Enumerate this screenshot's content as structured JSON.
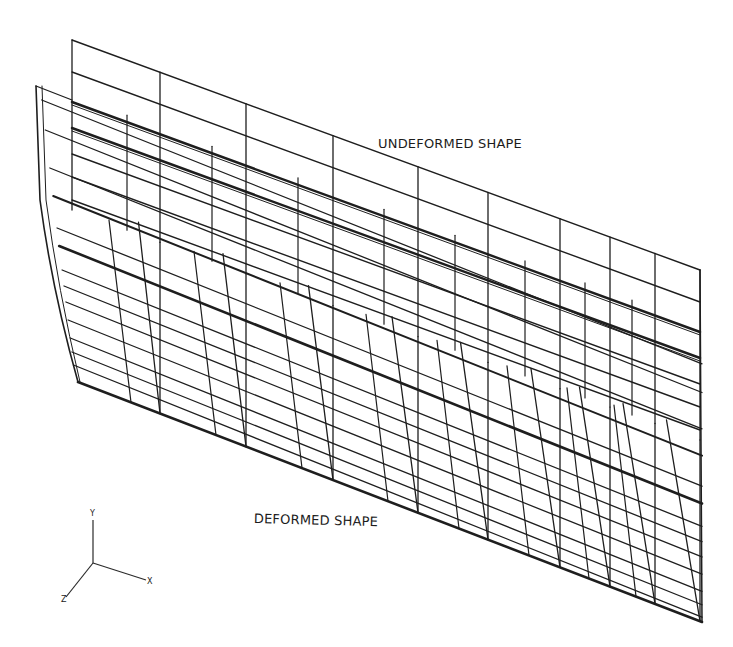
{
  "figure": {
    "labels": {
      "undeformed": "UNDEFORMED SHAPE",
      "deformed": "DEFORMED SHAPE"
    },
    "axes": {
      "y": "Y",
      "x": "X",
      "z": "Z"
    },
    "colors": {
      "line": "#1e1e1e",
      "background": "#ffffff"
    },
    "triad": {
      "origin": [
        93,
        563
      ],
      "y_end": [
        93,
        520
      ],
      "x_end": [
        146,
        580
      ],
      "z_end": [
        66,
        597
      ]
    },
    "undeformed_mesh": {
      "top_left": [
        72,
        40
      ],
      "top_right": [
        700,
        270
      ],
      "left_x": 72,
      "left_bottom": [
        78,
        382
      ],
      "row_offsets_left": [
        0,
        33,
        63,
        88,
        115,
        138,
        162,
        185
      ],
      "columns": [
        72,
        160,
        246,
        333,
        418,
        488,
        560,
        610,
        655,
        700
      ],
      "column_bottoms": [
        382,
        410,
        442,
        472,
        515,
        540,
        565,
        580,
        595,
        622
      ]
    },
    "deformed_mesh": {
      "top_left": [
        36,
        86
      ],
      "bottom_left": [
        78,
        382
      ],
      "bottom_right": [
        702,
        622
      ]
    }
  }
}
